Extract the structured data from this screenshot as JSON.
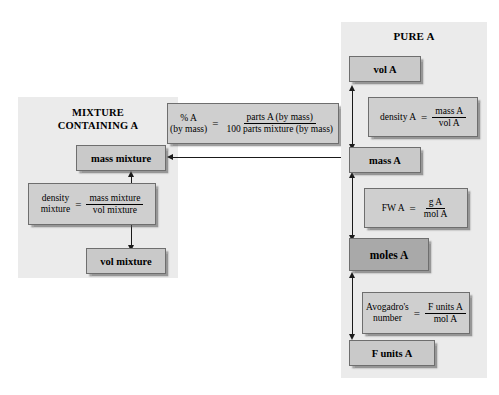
{
  "diagram": {
    "colors": {
      "panel_background": "#ebebeb",
      "box_fill": "#c9c9c9",
      "box_fill_highlight": "#a9a9a9",
      "formula_fill": "#cfcfcf",
      "box_border": "#6e6e6e",
      "arrow": "#1a1a1a",
      "page_background": "#ffffff"
    }
  },
  "mixture_panel": {
    "title_line1": "MIXTURE",
    "title_line2": "CONTAINING A",
    "boxes": {
      "mass_mixture": "mass mixture",
      "vol_mixture": "vol mixture"
    },
    "density_formula": {
      "lhs_line1": "density",
      "lhs_line2": "mixture",
      "equals": "=",
      "numerator": "mass mixture",
      "denominator": "vol mixture"
    }
  },
  "percent_formula": {
    "lhs_line1": "% A",
    "lhs_line2": "(by mass)",
    "equals": "=",
    "numerator": "parts A (by mass)",
    "denominator": "100 parts mixture (by mass)"
  },
  "pure_panel": {
    "title": "PURE A",
    "boxes": {
      "vol_a": "vol A",
      "mass_a": "mass A",
      "moles_a": "moles A",
      "f_units_a": "F units A"
    },
    "density_formula": {
      "lhs": "density A",
      "equals": "=",
      "numerator": "mass A",
      "denominator": "vol A"
    },
    "fw_formula": {
      "lhs": "FW A",
      "equals": "=",
      "numerator": "g A",
      "denominator": "mol A"
    },
    "avogadro_formula": {
      "lhs_line1": "Avogadro's",
      "lhs_line2": "number",
      "equals": "=",
      "numerator": "F units A",
      "denominator": "mol A"
    }
  }
}
